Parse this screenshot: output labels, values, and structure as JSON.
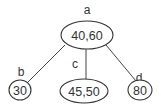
{
  "tree": {
    "root": {
      "name": "a",
      "value": "40,60"
    },
    "children": [
      {
        "name": "b",
        "value": "30"
      },
      {
        "name": "c",
        "value": "45,50"
      },
      {
        "name": "d",
        "value": "80"
      }
    ]
  }
}
